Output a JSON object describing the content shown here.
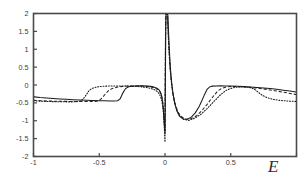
{
  "figure": {
    "background": "#ffffff",
    "frame_color": "#4a4a4a",
    "curve_color": "#1a1a1a",
    "axis_label_x": "E",
    "axis_label_y": ""
  },
  "chart_data": {
    "type": "line",
    "title": "",
    "subtitle": "",
    "xlabel": "E",
    "ylabel": "",
    "xlim": [
      -1,
      1
    ],
    "ylim": [
      -2,
      2
    ],
    "grid": false,
    "legend": "none",
    "xticks": [
      -1,
      -0.5,
      0,
      0.5,
      1
    ],
    "xticklabels": [
      "-1",
      "-0.5",
      "0",
      "0.5",
      "1"
    ],
    "yticks": [
      -2,
      -1.5,
      -1,
      -0.5,
      0,
      0.5,
      1,
      1.5,
      2
    ],
    "yticklabels": [
      "-2",
      "-1.5",
      "-1",
      "-0.5",
      "0",
      "0.5",
      "1",
      "1.5",
      "2"
    ],
    "annotations": [
      "Sharp positive resonance spike at E just above 0, clipped at ylim top (+2)",
      "Deep negative dips flanking E = 0 reaching about -1.3 to -1.6",
      "Step-like plateau transitions at |E| ~ 0.32, 0.50, 0.62"
    ],
    "series": [
      {
        "name": "solid",
        "style": "solid",
        "x": [
          -1.0,
          -0.95,
          -0.9,
          -0.85,
          -0.8,
          -0.75,
          -0.7,
          -0.65,
          -0.6,
          -0.55,
          -0.5,
          -0.46,
          -0.42,
          -0.39,
          -0.36,
          -0.34,
          -0.32,
          -0.3,
          -0.28,
          -0.26,
          -0.23,
          -0.2,
          -0.17,
          -0.14,
          -0.11,
          -0.09,
          -0.075,
          -0.062,
          -0.052,
          -0.044,
          -0.037,
          -0.031,
          -0.026,
          -0.022,
          -0.018,
          -0.015,
          -0.012,
          -0.009,
          -0.006,
          -0.004,
          -0.002,
          0.0,
          0.002,
          0.004,
          0.006,
          0.009,
          0.012,
          0.015,
          0.018,
          0.022,
          0.026,
          0.031,
          0.037,
          0.044,
          0.052,
          0.062,
          0.075,
          0.09,
          0.11,
          0.14,
          0.17,
          0.2,
          0.23,
          0.26,
          0.28,
          0.3,
          0.32,
          0.34,
          0.36,
          0.39,
          0.42,
          0.46,
          0.5,
          0.55,
          0.6,
          0.65,
          0.7,
          0.75,
          0.8,
          0.85,
          0.9,
          0.95,
          1.0
        ],
        "y": [
          -0.33,
          -0.35,
          -0.365,
          -0.378,
          -0.39,
          -0.4,
          -0.41,
          -0.418,
          -0.425,
          -0.432,
          -0.438,
          -0.442,
          -0.445,
          -0.447,
          -0.44,
          -0.38,
          -0.22,
          -0.1,
          -0.055,
          -0.038,
          -0.028,
          -0.024,
          -0.024,
          -0.028,
          -0.038,
          -0.052,
          -0.068,
          -0.09,
          -0.115,
          -0.145,
          -0.185,
          -0.235,
          -0.3,
          -0.38,
          -0.48,
          -0.59,
          -0.72,
          -0.87,
          -1.03,
          -1.16,
          -1.26,
          -1.3,
          -0.4,
          0.7,
          1.55,
          2.0,
          2.0,
          2.0,
          2.0,
          1.95,
          1.55,
          1.15,
          0.72,
          0.33,
          0.02,
          -0.26,
          -0.52,
          -0.72,
          -0.87,
          -0.95,
          -0.96,
          -0.9,
          -0.78,
          -0.6,
          -0.44,
          -0.27,
          -0.12,
          -0.052,
          -0.032,
          -0.026,
          -0.024,
          -0.026,
          -0.03,
          -0.036,
          -0.044,
          -0.055,
          -0.068,
          -0.082,
          -0.1,
          -0.12,
          -0.145,
          -0.17,
          -0.2
        ]
      },
      {
        "name": "dashed",
        "style": "dashed",
        "x": [
          -1.0,
          -0.95,
          -0.9,
          -0.85,
          -0.8,
          -0.76,
          -0.72,
          -0.68,
          -0.64,
          -0.6,
          -0.57,
          -0.54,
          -0.52,
          -0.5,
          -0.48,
          -0.46,
          -0.43,
          -0.4,
          -0.36,
          -0.32,
          -0.28,
          -0.24,
          -0.2,
          -0.16,
          -0.13,
          -0.1,
          -0.08,
          -0.065,
          -0.053,
          -0.044,
          -0.036,
          -0.03,
          -0.024,
          -0.02,
          -0.016,
          -0.013,
          -0.01,
          -0.007,
          -0.005,
          -0.003,
          -0.001,
          0.0,
          0.001,
          0.003,
          0.005,
          0.007,
          0.01,
          0.013,
          0.016,
          0.02,
          0.024,
          0.03,
          0.036,
          0.044,
          0.053,
          0.065,
          0.08,
          0.1,
          0.13,
          0.16,
          0.2,
          0.24,
          0.28,
          0.32,
          0.36,
          0.4,
          0.43,
          0.46,
          0.48,
          0.5,
          0.52,
          0.54,
          0.57,
          0.6,
          0.64,
          0.68,
          0.72,
          0.76,
          0.8,
          0.85,
          0.9,
          0.95,
          1.0
        ],
        "y": [
          -0.43,
          -0.44,
          -0.447,
          -0.452,
          -0.456,
          -0.458,
          -0.46,
          -0.461,
          -0.462,
          -0.462,
          -0.462,
          -0.46,
          -0.452,
          -0.43,
          -0.37,
          -0.28,
          -0.16,
          -0.095,
          -0.055,
          -0.038,
          -0.03,
          -0.027,
          -0.028,
          -0.034,
          -0.044,
          -0.06,
          -0.08,
          -0.103,
          -0.13,
          -0.165,
          -0.21,
          -0.265,
          -0.34,
          -0.42,
          -0.52,
          -0.64,
          -0.78,
          -0.94,
          -1.1,
          -1.23,
          -1.33,
          -1.38,
          -0.3,
          0.85,
          1.7,
          2.0,
          2.0,
          2.0,
          2.0,
          1.9,
          1.5,
          1.05,
          0.62,
          0.25,
          -0.06,
          -0.34,
          -0.58,
          -0.77,
          -0.9,
          -0.96,
          -0.94,
          -0.86,
          -0.72,
          -0.54,
          -0.35,
          -0.17,
          -0.095,
          -0.062,
          -0.048,
          -0.043,
          -0.042,
          -0.044,
          -0.048,
          -0.055,
          -0.066,
          -0.08,
          -0.096,
          -0.115,
          -0.138,
          -0.17,
          -0.2,
          -0.235,
          -0.27
        ]
      },
      {
        "name": "dotted",
        "style": "dotted",
        "x": [
          -1.0,
          -0.95,
          -0.9,
          -0.86,
          -0.82,
          -0.78,
          -0.74,
          -0.7,
          -0.68,
          -0.66,
          -0.64,
          -0.62,
          -0.6,
          -0.58,
          -0.56,
          -0.53,
          -0.5,
          -0.46,
          -0.42,
          -0.37,
          -0.32,
          -0.27,
          -0.22,
          -0.18,
          -0.14,
          -0.11,
          -0.09,
          -0.072,
          -0.058,
          -0.047,
          -0.038,
          -0.031,
          -0.025,
          -0.02,
          -0.016,
          -0.012,
          -0.009,
          -0.007,
          -0.005,
          -0.003,
          -0.0015,
          0.0,
          0.0015,
          0.003,
          0.005,
          0.007,
          0.009,
          0.012,
          0.016,
          0.02,
          0.025,
          0.031,
          0.038,
          0.047,
          0.058,
          0.072,
          0.09,
          0.11,
          0.14,
          0.18,
          0.22,
          0.27,
          0.32,
          0.37,
          0.42,
          0.46,
          0.5,
          0.53,
          0.56,
          0.58,
          0.6,
          0.62,
          0.64,
          0.66,
          0.68,
          0.7,
          0.74,
          0.78,
          0.82,
          0.86,
          0.9,
          0.95,
          1.0
        ],
        "y": [
          -0.44,
          -0.452,
          -0.46,
          -0.465,
          -0.468,
          -0.47,
          -0.472,
          -0.472,
          -0.47,
          -0.462,
          -0.44,
          -0.38,
          -0.28,
          -0.17,
          -0.105,
          -0.065,
          -0.045,
          -0.033,
          -0.028,
          -0.026,
          -0.027,
          -0.031,
          -0.04,
          -0.052,
          -0.07,
          -0.094,
          -0.118,
          -0.148,
          -0.185,
          -0.232,
          -0.29,
          -0.36,
          -0.44,
          -0.54,
          -0.65,
          -0.78,
          -0.93,
          -1.08,
          -1.22,
          -1.36,
          -1.5,
          -1.6,
          -0.2,
          1.1,
          1.85,
          2.0,
          2.0,
          2.0,
          2.0,
          1.8,
          1.35,
          0.9,
          0.48,
          0.12,
          -0.2,
          -0.48,
          -0.7,
          -0.86,
          -0.96,
          -0.99,
          -0.94,
          -0.83,
          -0.66,
          -0.47,
          -0.28,
          -0.16,
          -0.095,
          -0.068,
          -0.057,
          -0.055,
          -0.056,
          -0.06,
          -0.07,
          -0.088,
          -0.12,
          -0.175,
          -0.29,
          -0.36,
          -0.4,
          -0.425,
          -0.44,
          -0.452,
          -0.46
        ]
      }
    ]
  }
}
